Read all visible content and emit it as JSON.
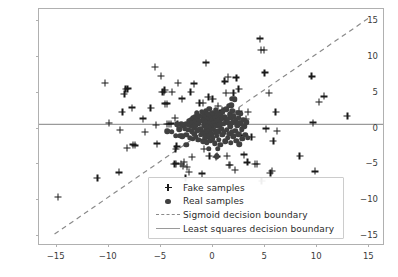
{
  "chart_data": {
    "type": "scatter",
    "title": "",
    "xlabel": "",
    "ylabel": "",
    "xlim": [
      -16.6,
      16.6
    ],
    "ylim": [
      -16.6,
      16.6
    ],
    "xticks": [
      -15,
      -10,
      -5,
      0,
      5,
      10,
      15
    ],
    "yticks": [
      -15,
      -10,
      -5,
      0,
      5,
      10,
      15
    ],
    "xticklabels": [
      "-15",
      "-10",
      "-5",
      "0",
      "5",
      "10",
      "15"
    ],
    "yticklabels": [
      "-15",
      "-10",
      "-5",
      "0",
      "5",
      "10",
      "15"
    ],
    "grid": false,
    "legend_position": "lower right",
    "colors": {
      "fake_marker": "#1a1a1a",
      "real_marker": "#404040",
      "sigmoid_line": "#8a8a8a",
      "least_squares_line": "#9a9a9a",
      "axes_edge": "#b0b0b0",
      "tick_text": "#3b3b3b",
      "legend_text": "#2b2b2b",
      "legend_border": "#cccccc",
      "background": "#ffffff"
    },
    "series": [
      {
        "name": "Fake samples",
        "marker": "+",
        "points": [
          [
            -14.8,
            -9.7
          ],
          [
            -11.0,
            -7.1
          ],
          [
            -10.3,
            6.2
          ],
          [
            -9.9,
            0.6
          ],
          [
            -8.9,
            -6.3
          ],
          [
            -8.8,
            -0.35
          ],
          [
            -8.6,
            2.2
          ],
          [
            -8.4,
            4.7
          ],
          [
            -8.3,
            5.4
          ],
          [
            -8.1,
            5.45
          ],
          [
            -8.15,
            -2.9
          ],
          [
            -7.7,
            2.8
          ],
          [
            -7.6,
            -2.4
          ],
          [
            -7.4,
            -2.5
          ],
          [
            -6.6,
            1.25
          ],
          [
            -6.4,
            -0.65
          ],
          [
            -5.9,
            2.75
          ],
          [
            -5.5,
            8.5
          ],
          [
            -5.35,
            0.4
          ],
          [
            -5.25,
            -2.25
          ],
          [
            -4.9,
            7.25
          ],
          [
            -4.75,
            4.95
          ],
          [
            -4.6,
            5.0
          ],
          [
            -4.55,
            5.25
          ],
          [
            -4.5,
            3.35
          ],
          [
            -4.35,
            3.35
          ],
          [
            -4.3,
            0.45
          ],
          [
            -4.15,
            0.5
          ],
          [
            -3.95,
            0.55
          ],
          [
            -3.85,
            4.95
          ],
          [
            -3.6,
            -5.1
          ],
          [
            -3.45,
            -5.05
          ],
          [
            -3.55,
            1.35
          ],
          [
            -3.5,
            -3.05
          ],
          [
            -3.4,
            -2.65
          ],
          [
            -3.3,
            0.5
          ],
          [
            -3.25,
            6.2
          ],
          [
            -3.0,
            -5.1
          ],
          [
            -2.85,
            4.05
          ],
          [
            -2.8,
            -5.4
          ],
          [
            -2.7,
            -4.85
          ],
          [
            -2.55,
            -7.05
          ],
          [
            -2.4,
            -5.5
          ],
          [
            -2.2,
            -6.2
          ],
          [
            -2.05,
            5.0
          ],
          [
            -1.95,
            -4.1
          ],
          [
            -1.7,
            6.15
          ],
          [
            -1.35,
            1.05
          ],
          [
            -1.2,
            3.4
          ],
          [
            -0.95,
            -6.45
          ],
          [
            -0.85,
            3.45
          ],
          [
            -0.75,
            -3.0
          ],
          [
            -0.6,
            9.1
          ],
          [
            -0.5,
            1.15
          ],
          [
            -0.35,
            4.25
          ],
          [
            -0.25,
            -3.95
          ],
          [
            0.05,
            3.95
          ],
          [
            0.2,
            0.95
          ],
          [
            0.35,
            -4.1
          ],
          [
            0.45,
            -4.05
          ],
          [
            0.6,
            3.0
          ],
          [
            0.75,
            1.3
          ],
          [
            0.95,
            2.4
          ],
          [
            1.1,
            2.3
          ],
          [
            1.2,
            6.45
          ],
          [
            1.35,
            4.8
          ],
          [
            1.45,
            -3.95
          ],
          [
            1.55,
            7.05
          ],
          [
            1.6,
            -5.25
          ],
          [
            1.75,
            -5.25
          ],
          [
            1.9,
            2.0
          ],
          [
            2.05,
            4.85
          ],
          [
            2.2,
            -5.95
          ],
          [
            2.35,
            7.0
          ],
          [
            2.4,
            1.2
          ],
          [
            2.55,
            5.4
          ],
          [
            2.6,
            2.25
          ],
          [
            2.75,
            -1.1
          ],
          [
            3.1,
            -3.8
          ],
          [
            3.25,
            1.2
          ],
          [
            3.4,
            -4.9
          ],
          [
            3.45,
            2.15
          ],
          [
            3.8,
            -1.35
          ],
          [
            4.15,
            -5.15
          ],
          [
            4.35,
            -5.15
          ],
          [
            4.6,
            12.45
          ],
          [
            4.7,
            10.85
          ],
          [
            4.75,
            -7.5
          ],
          [
            5.0,
            10.85
          ],
          [
            5.05,
            7.7
          ],
          [
            5.2,
            -0.15
          ],
          [
            5.45,
            4.85
          ],
          [
            5.6,
            -6.4
          ],
          [
            5.75,
            -6.05
          ],
          [
            5.9,
            -1.9
          ],
          [
            6.1,
            2.2
          ],
          [
            6.25,
            -0.45
          ],
          [
            8.4,
            -3.95
          ],
          [
            9.55,
            7.15
          ],
          [
            9.7,
            0.7
          ],
          [
            9.9,
            -6.15
          ],
          [
            10.25,
            3.55
          ],
          [
            10.75,
            4.35
          ],
          [
            13.0,
            1.65
          ]
        ]
      },
      {
        "name": "Real samples",
        "marker": "o",
        "points": [
          [
            -4.3,
            -0.55
          ],
          [
            -3.85,
            -0.6
          ],
          [
            -3.5,
            -1.15
          ],
          [
            -3.4,
            0.45
          ],
          [
            -3.15,
            -0.25
          ],
          [
            -3.05,
            -1.15
          ],
          [
            -2.95,
            0.45
          ],
          [
            -2.85,
            -1.25
          ],
          [
            -2.75,
            0.3
          ],
          [
            -2.6,
            -0.2
          ],
          [
            -2.5,
            0.55
          ],
          [
            -2.45,
            -1.0
          ],
          [
            -2.35,
            0.4
          ],
          [
            -2.3,
            -0.35
          ],
          [
            -2.2,
            0.85
          ],
          [
            -2.15,
            -1.45
          ],
          [
            -2.05,
            0.25
          ],
          [
            -2.0,
            1.1
          ],
          [
            -1.95,
            -0.55
          ],
          [
            -1.9,
            0.6
          ],
          [
            -1.85,
            -1.6
          ],
          [
            -1.8,
            1.35
          ],
          [
            -1.75,
            0.05
          ],
          [
            -1.7,
            -0.9
          ],
          [
            -1.65,
            1.5
          ],
          [
            -1.6,
            0.35
          ],
          [
            -1.55,
            -1.3
          ],
          [
            -1.5,
            0.9
          ],
          [
            -1.45,
            2.0
          ],
          [
            -1.4,
            -0.4
          ],
          [
            -1.35,
            1.2
          ],
          [
            -1.3,
            -1.75
          ],
          [
            -1.25,
            0.55
          ],
          [
            -1.2,
            1.65
          ],
          [
            -1.15,
            -0.15
          ],
          [
            -1.1,
            -1.05
          ],
          [
            -1.05,
            0.95
          ],
          [
            -1.0,
            2.2
          ],
          [
            -0.95,
            -0.6
          ],
          [
            -0.9,
            1.4
          ],
          [
            -0.85,
            -1.95
          ],
          [
            -0.8,
            0.35
          ],
          [
            -0.78,
            1.85
          ],
          [
            -0.75,
            -0.85
          ],
          [
            -0.7,
            1.05
          ],
          [
            -0.65,
            -1.4
          ],
          [
            -0.6,
            0.6
          ],
          [
            -0.58,
            2.35
          ],
          [
            -0.55,
            -0.25
          ],
          [
            -0.5,
            1.5
          ],
          [
            -0.48,
            -2.05
          ],
          [
            -0.45,
            0.85
          ],
          [
            -0.4,
            -0.65
          ],
          [
            -0.38,
            1.95
          ],
          [
            -0.35,
            0.2
          ],
          [
            -0.3,
            -1.25
          ],
          [
            -0.28,
            1.25
          ],
          [
            -0.25,
            2.6
          ],
          [
            -0.2,
            -0.45
          ],
          [
            -0.18,
            0.7
          ],
          [
            -0.15,
            -1.85
          ],
          [
            -0.1,
            1.6
          ],
          [
            -0.08,
            0.05
          ],
          [
            -0.05,
            -0.95
          ],
          [
            0.0,
            2.1
          ],
          [
            0.05,
            0.45
          ],
          [
            0.08,
            -1.5
          ],
          [
            0.1,
            1.15
          ],
          [
            0.15,
            -0.3
          ],
          [
            0.2,
            1.8
          ],
          [
            0.22,
            0.65
          ],
          [
            0.25,
            -2.2
          ],
          [
            0.3,
            1.4
          ],
          [
            0.35,
            -0.75
          ],
          [
            0.38,
            2.45
          ],
          [
            0.4,
            0.25
          ],
          [
            0.45,
            -1.15
          ],
          [
            0.5,
            1.6
          ],
          [
            0.55,
            0.85
          ],
          [
            0.58,
            -0.5
          ],
          [
            0.6,
            2.0
          ],
          [
            0.65,
            -1.7
          ],
          [
            0.7,
            1.05
          ],
          [
            0.75,
            0.35
          ],
          [
            0.8,
            -2.45
          ],
          [
            0.85,
            1.75
          ],
          [
            0.9,
            -0.2
          ],
          [
            0.95,
            1.3
          ],
          [
            1.0,
            -1.05
          ],
          [
            1.05,
            2.25
          ],
          [
            1.1,
            0.55
          ],
          [
            1.15,
            -0.7
          ],
          [
            1.2,
            1.5
          ],
          [
            1.25,
            -1.95
          ],
          [
            1.3,
            0.9
          ],
          [
            1.35,
            2.55
          ],
          [
            1.4,
            -0.35
          ],
          [
            1.45,
            1.2
          ],
          [
            1.5,
            -1.45
          ],
          [
            1.55,
            0.65
          ],
          [
            1.6,
            3.05
          ],
          [
            1.65,
            -0.9
          ],
          [
            1.7,
            1.85
          ],
          [
            1.75,
            0.15
          ],
          [
            1.8,
            -2.15
          ],
          [
            1.85,
            1.45
          ],
          [
            1.9,
            -0.6
          ],
          [
            1.95,
            2.35
          ],
          [
            2.0,
            0.75
          ],
          [
            2.05,
            -1.25
          ],
          [
            2.1,
            1.6
          ],
          [
            2.2,
            3.95
          ],
          [
            2.25,
            -0.45
          ],
          [
            2.3,
            1.05
          ],
          [
            2.35,
            -1.85
          ],
          [
            2.4,
            0.35
          ],
          [
            2.45,
            2.1
          ],
          [
            2.5,
            -0.95
          ],
          [
            2.55,
            1.35
          ],
          [
            2.6,
            -2.35
          ],
          [
            2.7,
            0.6
          ],
          [
            2.75,
            1.9
          ],
          [
            2.85,
            -0.25
          ],
          [
            2.9,
            -1.55
          ],
          [
            3.0,
            1.1
          ],
          [
            3.1,
            0.2
          ],
          [
            3.2,
            -1.05
          ],
          [
            3.3,
            0.75
          ],
          [
            3.45,
            -1.45
          ],
          [
            1.95,
            4.0
          ],
          [
            1.85,
            3.1
          ],
          [
            0.55,
            -3.0
          ],
          [
            0.45,
            -4.0
          ],
          [
            -0.3,
            -3.0
          ],
          [
            -2.45,
            -2.4
          ],
          [
            2.6,
            0.7
          ]
        ]
      }
    ],
    "lines": [
      {
        "name": "Sigmoid decision boundary",
        "style": "dashed",
        "from": [
          -15.1,
          -15.2
        ],
        "to": [
          15.2,
          15.3
        ]
      },
      {
        "name": "Least squares decision boundary",
        "style": "solid",
        "from": [
          -16.6,
          0.3
        ],
        "to": [
          16.6,
          0.3
        ]
      }
    ]
  },
  "legend": {
    "entries": [
      {
        "label": "Fake samples",
        "key": "plus-marker-icon"
      },
      {
        "label": "Real samples",
        "key": "dot-marker-icon"
      },
      {
        "label": "Sigmoid decision boundary",
        "key": "dashed-line-icon"
      },
      {
        "label": "Least squares decision boundary",
        "key": "solid-line-icon"
      }
    ]
  }
}
